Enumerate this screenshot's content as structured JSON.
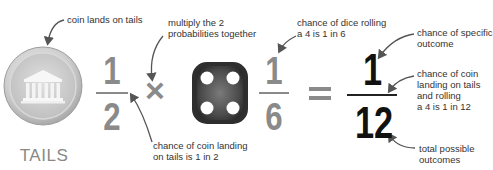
{
  "coin": {
    "label": "TAILS",
    "annotation": "coin lands on tails",
    "icon": "coin-temple-icon"
  },
  "coin_fraction": {
    "numerator": "1",
    "denominator": "2",
    "annotation_line1": "chance of coin landing",
    "annotation_line2": "on tails is 1 in 2"
  },
  "operator_multiply": {
    "symbol": "×",
    "annotation_line1": "multiply the 2",
    "annotation_line2": "probabilities together"
  },
  "dice": {
    "icon": "dice-four-icon",
    "face_value": 4
  },
  "dice_fraction": {
    "numerator": "1",
    "denominator": "6",
    "annotation_line1": "chance of dice rolling",
    "annotation_line2": "a 4 is 1 in 6"
  },
  "operator_equals": {
    "symbol": "="
  },
  "result_fraction": {
    "numerator": "1",
    "denominator": "12",
    "numerator_annotation_line1": "chance of specific",
    "numerator_annotation_line2": "outcome",
    "fraction_annotation_line1": "chance of coin",
    "fraction_annotation_line2": "landing on tails",
    "fraction_annotation_line3": "and rolling",
    "fraction_annotation_line4": "a 4 is 1 in 12",
    "denominator_annotation_line1": "total possible",
    "denominator_annotation_line2": "outcomes"
  },
  "colors": {
    "grey_numbers": "#8a8a8a",
    "black_numbers": "#111111",
    "arrow": "#555555",
    "coin": "#c8c8c8",
    "dice": "#3a3a3a"
  }
}
